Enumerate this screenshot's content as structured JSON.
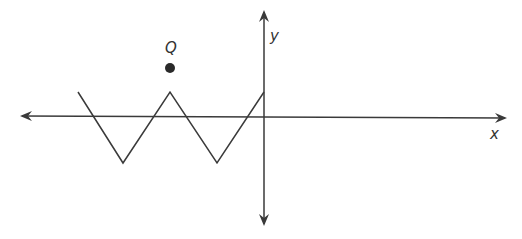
{
  "diagram": {
    "type": "coordinate-plane",
    "colors": {
      "axis": "#3a3a3a",
      "graph": "#3a3a3a",
      "point": "#2a2a2a",
      "label": "#333333"
    },
    "x_axis": {
      "label": "x"
    },
    "y_axis": {
      "label": "y"
    },
    "graph": {
      "description": "zigzag (piecewise linear) graph ending at the y-axis",
      "vertices": [
        [
          78,
          92
        ],
        [
          123,
          163
        ],
        [
          170,
          92
        ],
        [
          217,
          163
        ],
        [
          264,
          92
        ]
      ]
    },
    "points": [
      {
        "label": "Q",
        "x": 170,
        "y": 68
      }
    ]
  }
}
